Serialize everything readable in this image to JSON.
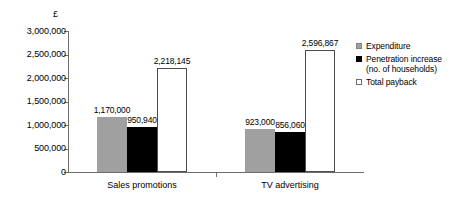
{
  "chart_data": {
    "type": "bar",
    "title": "",
    "subtitle": "",
    "xlabel": "",
    "ylabel": "£",
    "categories": [
      "Sales promotions",
      "TV advertising"
    ],
    "series": [
      {
        "name": "Expenditure",
        "color": "#a0a0a0",
        "values": [
          1170000,
          923000
        ],
        "labels": [
          "1,170,000",
          "923,000"
        ]
      },
      {
        "name": "Penetration increase (no. of households)",
        "legend_line1": "Penetration increase",
        "legend_line2": "(no. of households)",
        "color": "#000000",
        "values": [
          950940,
          856060
        ],
        "labels": [
          "950,940",
          "856,060"
        ]
      },
      {
        "name": "Total payback",
        "color": "#ffffff",
        "values": [
          2218145,
          2596867
        ],
        "labels": [
          "2,218,145",
          "2,596,867"
        ]
      }
    ],
    "ylim": [
      0,
      3000000
    ],
    "ytick_values": [
      0,
      500000,
      1000000,
      1500000,
      2000000,
      2500000,
      3000000
    ],
    "ytick_labels": [
      "0",
      "500,000",
      "1,000,000",
      "1,500,000",
      "2,000,000",
      "2,500,000",
      "3,000,000"
    ],
    "grid": false,
    "legend_position": "right"
  },
  "axis": {
    "currency_symbol": "£"
  }
}
